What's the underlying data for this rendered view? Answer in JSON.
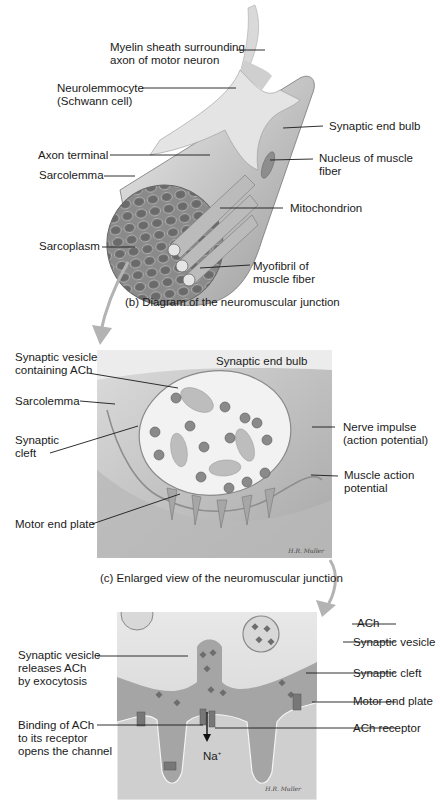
{
  "figure": {
    "panel_b": {
      "caption": "(b) Diagram of the neuromuscular junction",
      "labels": {
        "myelin": "Myelin sheath surrounding\naxon of motor neuron",
        "neurolemmocyte": "Neurolemmocyte\n(Schwann cell)",
        "synaptic_end_bulb": "Synaptic end bulb",
        "axon_terminal": "Axon terminal",
        "nucleus": "Nucleus of muscle\nfiber",
        "sarcolemma": "Sarcolemma",
        "mitochondrion": "Mitochondrion",
        "sarcoplasm": "Sarcoplasm",
        "myofibril": "Myofibril of\nmuscle fiber"
      }
    },
    "panel_c": {
      "caption": "(c) Enlarged view of the neuromuscular junction",
      "title_in_art": "Synaptic end bulb",
      "labels": {
        "vesicle_ach": "Synaptic vesicle\ncontaining ACh",
        "sarcolemma": "Sarcolemma",
        "synaptic_cleft": "Synaptic\ncleft",
        "nerve_impulse": "Nerve impulse\n(action potential)",
        "muscle_action": "Muscle action\npotential",
        "motor_end_plate": "Motor end plate"
      },
      "signature": "H.R. Muller"
    },
    "panel_d": {
      "labels": {
        "ach": "ACh",
        "synaptic_vesicle": "Synaptic vesicle",
        "vesicle_releases": "Synaptic vesicle\nreleases ACh\nby exocytosis",
        "synaptic_cleft": "Synaptic cleft",
        "motor_end_plate": "Motor end plate",
        "binding": "Binding of ACh\nto its receptor\nopens the channel",
        "ach_receptor": "ACh receptor",
        "na": "Na",
        "na_sup": "+"
      },
      "signature": "H.R. Muller"
    },
    "colors": {
      "art_light": "#e6e6e6",
      "art_mid": "#bdbdbd",
      "art_dark": "#7d7d7d",
      "arrow": "#b3b3b3",
      "leader": "#1a1a1a"
    }
  }
}
